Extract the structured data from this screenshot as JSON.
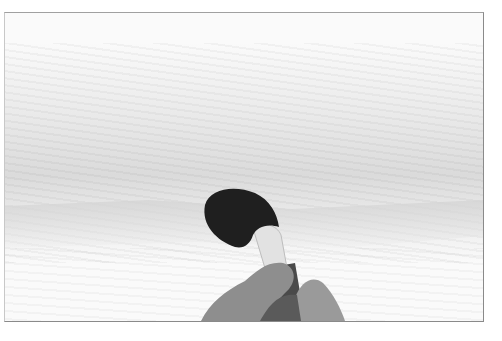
{
  "image": {
    "description": "Grayscale photograph of a hand holding a dark, rounded watercolor mop brush pressed against textured wet paper with a grey wash",
    "colors": {
      "brush_head": "#1e1e1e",
      "ferrule": "#e4e4e4",
      "hand": "#8c8c8c",
      "handle": "#4a4a4a",
      "paper": "#fafafa",
      "wash": "#d6d6d6",
      "frame_border": "#8a8a8a"
    }
  }
}
